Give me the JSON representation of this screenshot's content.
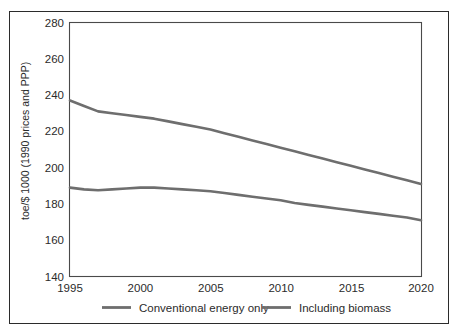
{
  "chart_data": {
    "type": "line",
    "title": "",
    "xlabel": "",
    "ylabel": "toe/$ 1000 (1990 prices and PPP)",
    "xlim": [
      1995,
      2020
    ],
    "ylim": [
      140,
      280
    ],
    "xticks": [
      "1995",
      "2000",
      "2005",
      "2010",
      "2015",
      "2020"
    ],
    "yticks": [
      "140",
      "160",
      "180",
      "200",
      "220",
      "240",
      "260",
      "280"
    ],
    "grid": false,
    "legend_position": "bottom",
    "x": [
      1995,
      1996,
      1997,
      1998,
      1999,
      2000,
      2001,
      2002,
      2003,
      2004,
      2005,
      2006,
      2007,
      2008,
      2009,
      2010,
      2011,
      2012,
      2013,
      2014,
      2015,
      2016,
      2017,
      2018,
      2019,
      2020
    ],
    "series": [
      {
        "name": "Including biomass",
        "color": "#6e6e6e",
        "values": [
          237,
          234,
          231,
          230,
          229,
          228,
          227,
          225.5,
          224,
          222.5,
          221,
          219,
          217,
          215,
          213,
          211,
          209,
          207,
          205,
          203,
          201,
          199,
          197,
          195,
          193,
          191
        ]
      },
      {
        "name": "Conventional energy only",
        "color": "#6e6e6e",
        "values": [
          189,
          188,
          187.5,
          188,
          188.5,
          189,
          189,
          188.5,
          188,
          187.5,
          187,
          186,
          185,
          184,
          183,
          182,
          180.5,
          179.5,
          178.5,
          177.5,
          176.5,
          175.5,
          174.5,
          173.5,
          172.5,
          171
        ]
      }
    ],
    "legend": [
      {
        "label": "Conventional energy only",
        "color": "#6e6e6e"
      },
      {
        "label": "Including biomass",
        "color": "#6e6e6e"
      }
    ],
    "colors": {
      "axis": "#4a4a4a",
      "frame": "#2b2b2b",
      "text": "#2b2b2b",
      "background": "#ffffff",
      "line": "#6e6e6e"
    }
  }
}
